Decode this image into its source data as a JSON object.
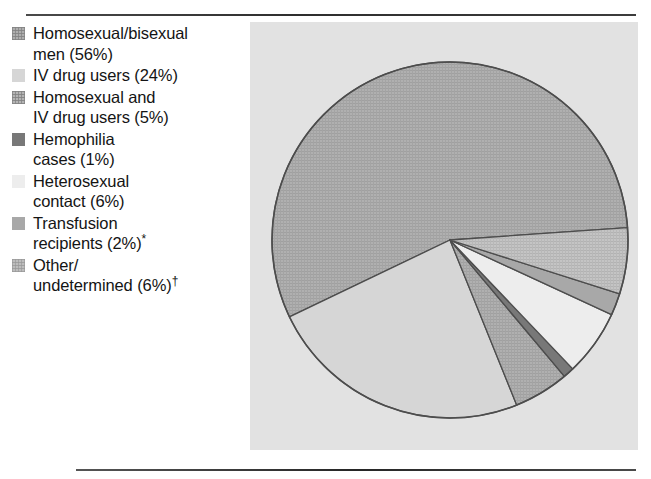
{
  "figure": {
    "panel_background": "#e2e2e2",
    "page_background": "#ffffff",
    "rule_color": "#2e2e2e"
  },
  "legend": {
    "items": [
      {
        "label": "Homosexual/bisexual\nmen (56%)",
        "category": "Homosexual/bisexual men",
        "percent": 56,
        "swatch": "#aeaeae",
        "pattern": "hatch-medium",
        "footnote": ""
      },
      {
        "label": "IV drug users (24%)",
        "category": "IV drug users",
        "percent": 24,
        "swatch": "#d6d6d6",
        "pattern": "solid",
        "footnote": ""
      },
      {
        "label": "Homosexual and\nIV drug users (5%)",
        "category": "Homosexual and IV drug users",
        "percent": 5,
        "swatch": "#b4b4b4",
        "pattern": "hatch-medium",
        "footnote": ""
      },
      {
        "label": "Hemophilia\ncases (1%)",
        "category": "Hemophilia cases",
        "percent": 1,
        "swatch": "#787878",
        "pattern": "solid",
        "footnote": ""
      },
      {
        "label": "Heterosexual\ncontact (6%)",
        "category": "Heterosexual contact",
        "percent": 6,
        "swatch": "#ededed",
        "pattern": "solid",
        "footnote": ""
      },
      {
        "label": "Transfusion\nrecipients (2%)",
        "category": "Transfusion recipients",
        "percent": 2,
        "swatch": "#a8a8a8",
        "pattern": "solid",
        "footnote": "*"
      },
      {
        "label": "Other/\nundetermined (6%)",
        "category": "Other/undetermined",
        "percent": 6,
        "swatch": "#bdbdbd",
        "pattern": "hatch-light",
        "footnote": "†"
      }
    ]
  },
  "chart_data": {
    "type": "pie",
    "xlabel": "",
    "ylabel": "",
    "legend_position": "left",
    "grid": false,
    "units": "percent",
    "total": 100,
    "center": {
      "x": 450,
      "y": 240
    },
    "radius": 178,
    "start_angle_deg": 356,
    "direction": "counterclockwise",
    "categories": [
      "Homosexual/bisexual men",
      "IV drug users",
      "Homosexual and IV drug users",
      "Hemophilia cases",
      "Heterosexual contact",
      "Transfusion recipients",
      "Other/undetermined"
    ],
    "values": [
      56,
      24,
      5,
      1,
      6,
      2,
      6
    ],
    "labels": [
      "Homosexual/bisexual men (56%)",
      "IV drug users (24%)",
      "Homosexual and IV drug users (5%)",
      "Hemophilia cases (1%)",
      "Heterosexual contact (6%)",
      "Transfusion recipients (2%)*",
      "Other/undetermined (6%)†"
    ],
    "colors": [
      "#aeaeae",
      "#d6d6d6",
      "#b4b4b4",
      "#787878",
      "#ededed",
      "#a8a8a8",
      "#bdbdbd"
    ],
    "patterns": [
      "hatch-medium",
      "solid",
      "hatch-medium",
      "solid",
      "solid",
      "solid",
      "hatch-light"
    ],
    "slice_outline": "#4d4d4d"
  }
}
